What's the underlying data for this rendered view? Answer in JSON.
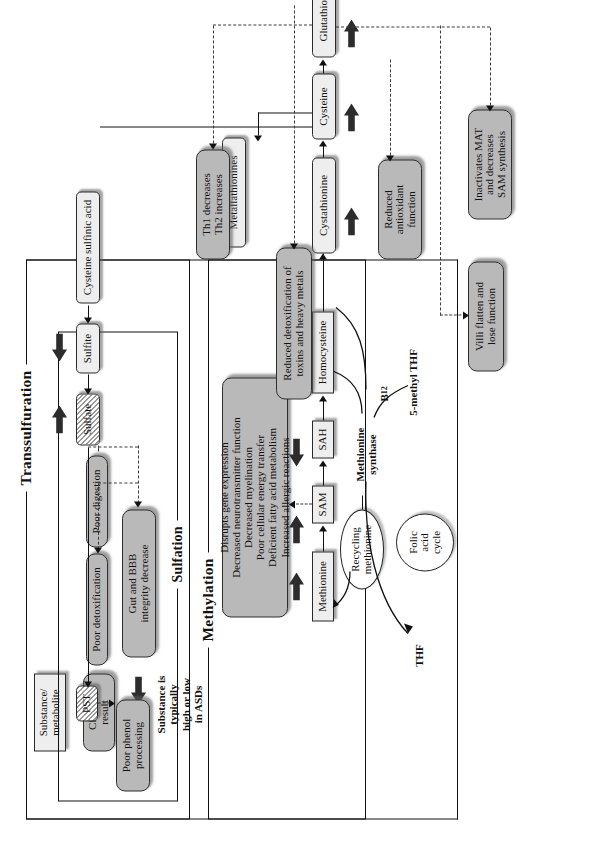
{
  "figure": {
    "type": "pathway-diagram",
    "orientation": "rotated-90-ccw",
    "colors": {
      "substance_fill": "#eeeeee",
      "clinical_fill": "#b9b9b9",
      "stroke": "#111111",
      "hatch": "#9b9b9b"
    }
  },
  "legend": {
    "substance_label": "Substance/\nmetabolite",
    "substance_line1": "Substance/",
    "substance_line2": "metabolite",
    "clinical_line1": "Clinical",
    "clinical_line2": "result",
    "arrow_note_line1": "Substance is",
    "arrow_note_line2": "typically",
    "arrow_note_line3": "high or low",
    "arrow_note_line4": "in ASDs"
  },
  "sections": {
    "methylation": "Methylation",
    "transsulfuration": "Transsulfuration",
    "sulfation": "Sulfation"
  },
  "methylation": {
    "effects": {
      "line1": "Disrupts gene expression",
      "line2": "Decreased neurotransmitter function",
      "line3": "Decreased myelination",
      "line4": "Poor cellular energy transfer",
      "line5": "Deficient fatty acid metabolism",
      "line6": "Increased allergic reactions"
    },
    "nodes": {
      "methionine": "Methionine",
      "sam": "SAM",
      "sah": "SAH",
      "homocysteine": "Homocysteine"
    },
    "recycling": {
      "line1": "Recycling",
      "line2": "methionine"
    },
    "enzyme": {
      "line1": "Methionine",
      "line2": "synthase"
    },
    "folic": {
      "line1": "Folic",
      "line2": "acid",
      "line3": "cycle"
    },
    "thf": "THF",
    "b12": "B",
    "b12_sub": "12",
    "five_methyl_thf": "5-methyl THF"
  },
  "transsulfuration": {
    "nodes": {
      "cystathionine": "Cystathionine",
      "cysteine": "Cysteine",
      "glutathione": "Glutathione",
      "metallathionines": "Metallathionines",
      "cysteine_sulfinic_acid": "Cysteine sulfinic acid",
      "sulfite": "Sulfite",
      "sulfate": "Sulfate",
      "pst": "PST"
    },
    "results": {
      "poor_phenol_l1": "Poor phenol",
      "poor_phenol_l2": "processing",
      "poor_detoxification": "Poor detoxification",
      "poor_digestion": "Poor digestion",
      "gut_bbb_l1": "Gut and BBB",
      "gut_bbb_l2": "integrity decrease",
      "th1_l1": "Th1 decreases",
      "th1_l2": "Th2 increases",
      "reduced_antioxidant_l1": "Reduced",
      "reduced_antioxidant_l2": "antioxidant",
      "reduced_antioxidant_l3": "function",
      "reduced_detox_l1": "Reduced detoxification of",
      "reduced_detox_l2": "toxins and heavy metals",
      "inactivates_mat_l1": "Inactivates MAT",
      "inactivates_mat_l2": "and decreases",
      "inactivates_mat_l3": "SAM synthesis",
      "villi_l1": "Villi flatten and",
      "villi_l2": "lose function"
    }
  },
  "markers": {
    "high_arrow": "arrow-right-thick",
    "low_arrow": "arrow-left-thick"
  }
}
